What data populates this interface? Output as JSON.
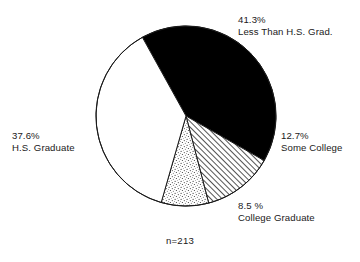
{
  "chart_data": {
    "type": "pie",
    "title": "",
    "xlabel": "",
    "ylabel": "",
    "legend_position": "callout-labels",
    "grid": false,
    "sample_size_note": "n=213",
    "categories": [
      "Less Than H.S. Grad.",
      "Some College",
      "College Graduate",
      "H.S. Graduate"
    ],
    "values": [
      41.3,
      12.7,
      8.5,
      37.6
    ],
    "value_labels": [
      "41.3%",
      "12.7%",
      "8.5 %",
      "37.6%"
    ],
    "slices": [
      {
        "label": "Less Than H.S. Grad.",
        "value": 41.3,
        "value_label": "41.3%",
        "fill": "solid-black",
        "color": "#000000",
        "start_angle": -119.0,
        "end_angle": 29.7
      },
      {
        "label": "Some College",
        "value": 12.7,
        "value_label": "12.7%",
        "fill": "diagonal-hatch",
        "color": "#ffffff",
        "start_angle": 29.7,
        "end_angle": 75.4
      },
      {
        "label": "College Graduate",
        "value": 8.5,
        "value_label": "8.5 %",
        "fill": "stipple-dots",
        "color": "#ffffff",
        "start_angle": 75.4,
        "end_angle": 106.0
      },
      {
        "label": "H.S. Graduate",
        "value": 37.6,
        "value_label": "37.6%",
        "fill": "solid-white",
        "color": "#ffffff",
        "start_angle": 106.0,
        "end_angle": 241.0
      }
    ]
  },
  "labels": {
    "less_than_hs": {
      "pct": "41.3%",
      "cat": "Less Than H.S. Grad."
    },
    "some_college": {
      "pct": "12.7%",
      "cat": "Some College"
    },
    "college_grad": {
      "pct": "8.5 %",
      "cat": "College Graduate"
    },
    "hs_graduate": {
      "pct": "37.6%",
      "cat": "H.S. Graduate"
    }
  },
  "footnote": {
    "sample_size": "n=213"
  },
  "style": {
    "outline_color": "#1a1a1a",
    "black_slice_color": "#000000",
    "background": "#ffffff"
  }
}
